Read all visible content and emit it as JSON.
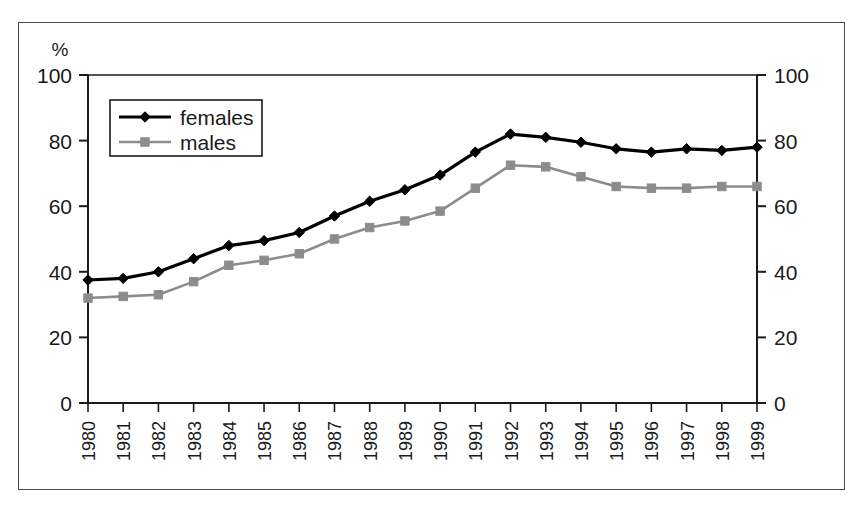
{
  "figure": {
    "axis_note": "%",
    "frame_color": "#4a4a4a"
  },
  "legend": {
    "position": "top-left-inside",
    "entries": [
      {
        "label": "females",
        "color": "#000000",
        "marker": "diamond"
      },
      {
        "label": "males",
        "color": "#8c8c8c",
        "marker": "square"
      }
    ]
  },
  "axes": {
    "y_left_ticks": [
      "0",
      "20",
      "40",
      "60",
      "80",
      "100"
    ],
    "y_right_ticks": [
      "0",
      "20",
      "40",
      "60",
      "80",
      "100"
    ],
    "x_ticks": [
      "1980",
      "1981",
      "1982",
      "1983",
      "1984",
      "1985",
      "1986",
      "1987",
      "1988",
      "1989",
      "1990",
      "1991",
      "1992",
      "1993",
      "1994",
      "1995",
      "1996",
      "1997",
      "1998",
      "1999"
    ]
  },
  "chart_data": {
    "type": "line",
    "title": "",
    "subtitle": "",
    "xlabel": "",
    "ylabel": "%",
    "ylim": [
      0,
      100
    ],
    "y_ticks": [
      0,
      20,
      40,
      60,
      80,
      100
    ],
    "grid": false,
    "legend_position": "upper left (inside plot)",
    "dual_y_axis": true,
    "y_right_label": "",
    "y_right_lim": [
      0,
      100
    ],
    "y_right_ticks": [
      0,
      20,
      40,
      60,
      80,
      100
    ],
    "categories": [
      1980,
      1981,
      1982,
      1983,
      1984,
      1985,
      1986,
      1987,
      1988,
      1989,
      1990,
      1991,
      1992,
      1993,
      1994,
      1995,
      1996,
      1997,
      1998,
      1999
    ],
    "series": [
      {
        "name": "females",
        "color": "#000000",
        "marker": "diamond",
        "values": [
          37.5,
          38,
          40,
          44,
          48,
          49.5,
          52,
          57,
          61.5,
          65,
          69.5,
          76.5,
          82,
          81,
          79.5,
          77.5,
          76.5,
          77.5,
          77,
          78
        ]
      },
      {
        "name": "males",
        "color": "#8c8c8c",
        "marker": "square",
        "values": [
          32,
          32.5,
          33,
          37,
          42,
          43.5,
          45.5,
          50,
          53.5,
          55.5,
          58.5,
          65.5,
          72.5,
          72,
          69,
          66,
          65.5,
          65.5,
          66,
          66
        ]
      }
    ]
  }
}
